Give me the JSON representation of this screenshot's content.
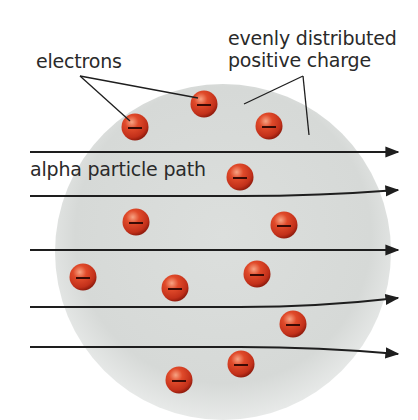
{
  "diagram": {
    "labels": {
      "electrons": "electrons",
      "positive_charge_line1": "evenly distributed",
      "positive_charge_line2": "positive charge",
      "alpha_path": "alpha particle path"
    },
    "colors": {
      "sphere": "#d9dcda",
      "electron": "#d8321e",
      "electron_dark": "#8e1a0c",
      "line": "#1e1e1e",
      "text": "#2a2a2a"
    },
    "sphere": {
      "cx": 223,
      "cy": 252,
      "r": 168
    },
    "electrons": [
      {
        "x": 135,
        "y": 127
      },
      {
        "x": 204,
        "y": 104
      },
      {
        "x": 269,
        "y": 126
      },
      {
        "x": 240,
        "y": 177
      },
      {
        "x": 136,
        "y": 222
      },
      {
        "x": 284,
        "y": 225
      },
      {
        "x": 83,
        "y": 277
      },
      {
        "x": 175,
        "y": 288
      },
      {
        "x": 257,
        "y": 274
      },
      {
        "x": 293,
        "y": 324
      },
      {
        "x": 241,
        "y": 364
      },
      {
        "x": 179,
        "y": 380
      }
    ],
    "alpha_paths": [
      {
        "y_start": 152,
        "y_end": 152,
        "deflection": "none"
      },
      {
        "y_start": 196,
        "y_end": 190,
        "deflection": "slight-up"
      },
      {
        "y_start": 250,
        "y_end": 250,
        "deflection": "none"
      },
      {
        "y_start": 307,
        "y_end": 298,
        "deflection": "slight-up"
      },
      {
        "y_start": 347,
        "y_end": 354,
        "deflection": "slight-down"
      }
    ]
  }
}
